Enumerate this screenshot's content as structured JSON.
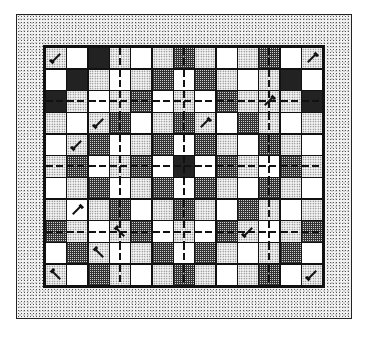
{
  "quilt": {
    "title": "Quilt pattern grid",
    "columns": 13,
    "rows": 11,
    "legend": {
      "W": "white",
      "S": "light stipple",
      "D": "dark crosshatch",
      "C": "dark checker"
    },
    "colors": {
      "border_fill": "#f1f1f1",
      "grid_lines": "#111111",
      "white": "#ffffff",
      "stipple": "#f4f4f4",
      "crosshatch": "#333333"
    },
    "dashed_rows": [
      2,
      5,
      8
    ],
    "dashed_cols": [
      3,
      6,
      10
    ],
    "grid": [
      [
        "S",
        "W",
        "C",
        "S",
        "W",
        "S",
        "D",
        "S",
        "W",
        "S",
        "D",
        "W",
        "S"
      ],
      [
        "W",
        "C",
        "S",
        "W",
        "S",
        "D",
        "W",
        "D",
        "S",
        "W",
        "S",
        "C",
        "W"
      ],
      [
        "C",
        "S",
        "W",
        "S",
        "D",
        "W",
        "S",
        "W",
        "D",
        "S",
        "S",
        "S",
        "C"
      ],
      [
        "S",
        "W",
        "S",
        "D",
        "W",
        "S",
        "D",
        "S",
        "W",
        "D",
        "S",
        "W",
        "S"
      ],
      [
        "W",
        "S",
        "D",
        "W",
        "S",
        "D",
        "W",
        "D",
        "S",
        "W",
        "D",
        "S",
        "W"
      ],
      [
        "S",
        "D",
        "W",
        "S",
        "D",
        "W",
        "C",
        "W",
        "D",
        "S",
        "W",
        "D",
        "S"
      ],
      [
        "W",
        "S",
        "D",
        "W",
        "S",
        "D",
        "W",
        "D",
        "S",
        "W",
        "D",
        "S",
        "W"
      ],
      [
        "S",
        "W",
        "S",
        "D",
        "W",
        "S",
        "D",
        "S",
        "W",
        "D",
        "S",
        "W",
        "S"
      ],
      [
        "D",
        "S",
        "W",
        "S",
        "D",
        "W",
        "S",
        "W",
        "D",
        "S",
        "W",
        "S",
        "D"
      ],
      [
        "W",
        "D",
        "S",
        "W",
        "S",
        "D",
        "W",
        "D",
        "S",
        "W",
        "S",
        "D",
        "W"
      ],
      [
        "S",
        "W",
        "D",
        "S",
        "W",
        "S",
        "D",
        "S",
        "W",
        "S",
        "D",
        "W",
        "S"
      ]
    ],
    "arrows": [
      {
        "row": 0,
        "col": 0,
        "dir": "se"
      },
      {
        "row": 0,
        "col": 12,
        "dir": "ne"
      },
      {
        "row": 2,
        "col": 10,
        "dir": "ne"
      },
      {
        "row": 3,
        "col": 2,
        "dir": "se"
      },
      {
        "row": 3,
        "col": 7,
        "dir": "ne"
      },
      {
        "row": 4,
        "col": 1,
        "dir": "se"
      },
      {
        "row": 7,
        "col": 1,
        "dir": "ne"
      },
      {
        "row": 8,
        "col": 3,
        "dir": "sw"
      },
      {
        "row": 8,
        "col": 9,
        "dir": "se"
      },
      {
        "row": 9,
        "col": 2,
        "dir": "sw"
      },
      {
        "row": 10,
        "col": 0,
        "dir": "sw"
      },
      {
        "row": 10,
        "col": 12,
        "dir": "se"
      }
    ]
  }
}
